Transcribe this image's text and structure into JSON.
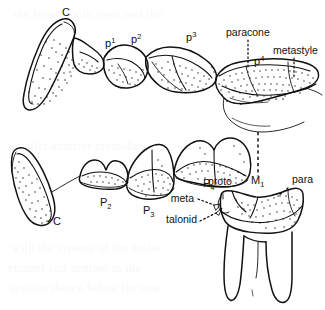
{
  "figure": {
    "ink_color": "#111111",
    "background_color": "#ffffff"
  },
  "upper_row": {
    "name": "upper tooth row",
    "labels": [
      {
        "id": "upper-canine",
        "text": "C",
        "x": 66,
        "y": 16
      },
      {
        "id": "upper-p1",
        "base": "p",
        "sup": "1",
        "x": 105,
        "y": 47
      },
      {
        "id": "upper-p2",
        "base": "p",
        "sup": "2",
        "x": 131,
        "y": 43
      },
      {
        "id": "upper-p3",
        "base": "p",
        "sup": "3",
        "x": 186,
        "y": 41
      },
      {
        "id": "upper-p4",
        "base": "p",
        "sup": "4",
        "x": 254,
        "y": 65
      }
    ],
    "leader_labels": [
      {
        "id": "paracone",
        "text": "paracone",
        "x": 226,
        "y": 36,
        "anchor": "start"
      },
      {
        "id": "metastyle",
        "text": "metastyle",
        "x": 273,
        "y": 54,
        "anchor": "start"
      }
    ]
  },
  "lower_row": {
    "name": "lower tooth row",
    "labels": [
      {
        "id": "lower-canine",
        "text": "C",
        "x": 57,
        "y": 225
      },
      {
        "id": "lower-p2",
        "base": "P",
        "sub": "2",
        "x": 100,
        "y": 206
      },
      {
        "id": "lower-p3",
        "base": "P",
        "sub": "3",
        "x": 143,
        "y": 214
      },
      {
        "id": "lower-p4",
        "base": "P",
        "sub": "4",
        "x": 203,
        "y": 187
      },
      {
        "id": "lower-m1",
        "base": "M",
        "sub": "1",
        "x": 251,
        "y": 184
      }
    ],
    "cusp_labels": [
      {
        "id": "proto",
        "text": "proto",
        "x": 208,
        "y": 185,
        "anchor": "start"
      },
      {
        "id": "para",
        "text": "para",
        "x": 292,
        "y": 183,
        "anchor": "start"
      },
      {
        "id": "meta",
        "text": "meta",
        "x": 194,
        "y": 202,
        "anchor": "end"
      },
      {
        "id": "talonid",
        "text": "talonid",
        "x": 197,
        "y": 223,
        "anchor": "end"
      }
    ]
  },
  "ghost_text": {
    "note": "faint show-through of printed text from reverse of page",
    "lines": [
      "the lower tooth rows and the",
      "smaller anterior premolars",
      "with the crowns of the molar",
      "enamel and dentine in the",
      "section shown below the row"
    ]
  }
}
